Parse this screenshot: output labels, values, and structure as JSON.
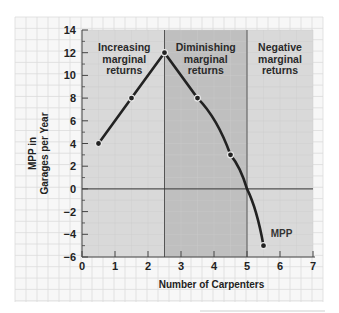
{
  "chart_data": {
    "type": "line",
    "title": "",
    "xlabel": "Number of Carpenters",
    "ylabel_lines": [
      "MPP in",
      "Garages per Year"
    ],
    "xlim": [
      0,
      7
    ],
    "ylim": [
      -6,
      14
    ],
    "x_ticks": [
      0,
      1,
      2,
      3,
      4,
      5,
      6,
      7
    ],
    "y_ticks": [
      -6,
      -4,
      -2,
      0,
      2,
      4,
      6,
      8,
      10,
      12,
      14
    ],
    "x_tick_labels": [
      "0",
      "1",
      "2",
      "3",
      "4",
      "5",
      "6",
      "7"
    ],
    "y_tick_labels": [
      "−6",
      "−4",
      "−2",
      "0",
      "2",
      "4",
      "6",
      "8",
      "10",
      "12",
      "14"
    ],
    "grid": true,
    "series": [
      {
        "name": "MPP",
        "x": [
          0.5,
          1.5,
          2.5,
          3.5,
          4.5,
          5.0,
          5.5
        ],
        "y": [
          4,
          8,
          12,
          8,
          3,
          0,
          -5
        ],
        "markers": [
          true,
          true,
          true,
          true,
          true,
          false,
          true
        ]
      }
    ],
    "regions": [
      {
        "label_lines": [
          "Increasing",
          "marginal",
          "returns"
        ],
        "x_range": [
          0,
          2.5
        ],
        "color": "#d9d9d9"
      },
      {
        "label_lines": [
          "Diminishing",
          "marginal",
          "returns"
        ],
        "x_range": [
          2.5,
          5
        ],
        "color": "#bfbfbf"
      },
      {
        "label_lines": [
          "Negative",
          "marginal",
          "returns"
        ],
        "x_range": [
          5,
          7
        ],
        "color": "#d9d9d9"
      }
    ],
    "line_color": "#222222",
    "paper_color": "#f7f7f7"
  }
}
